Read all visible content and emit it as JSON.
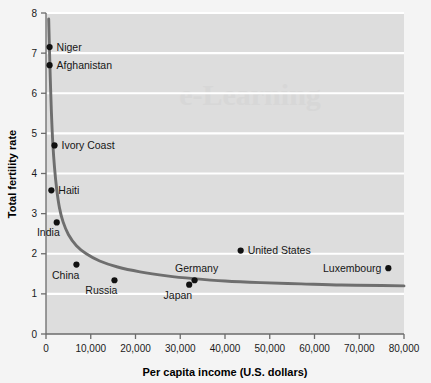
{
  "chart_data": {
    "type": "scatter",
    "title": "",
    "xlabel": "Per capita income (U.S. dollars)",
    "ylabel": "Total fertility rate",
    "xlim": [
      0,
      80000
    ],
    "ylim": [
      0,
      8
    ],
    "xticks": [
      0,
      10000,
      20000,
      30000,
      40000,
      50000,
      60000,
      70000,
      80000
    ],
    "xticklabels": [
      "0",
      "10,000",
      "20,000",
      "30,000",
      "40,000",
      "50,000",
      "60,000",
      "70,000",
      "80,000"
    ],
    "yticks": [
      0,
      1,
      2,
      3,
      4,
      5,
      6,
      7,
      8
    ],
    "yticklabels": [
      "0",
      "1",
      "2",
      "3",
      "4",
      "5",
      "6",
      "7",
      "8"
    ],
    "grid": "horizontal",
    "legend": "none",
    "points": [
      {
        "label": "Niger",
        "x": 800,
        "y": 7.15,
        "label_pos": "right"
      },
      {
        "label": "Afghanistan",
        "x": 800,
        "y": 6.7,
        "label_pos": "right"
      },
      {
        "label": "Ivory Coast",
        "x": 1900,
        "y": 4.7,
        "label_pos": "right"
      },
      {
        "label": "Haiti",
        "x": 1200,
        "y": 3.58,
        "label_pos": "right"
      },
      {
        "label": "India",
        "x": 2400,
        "y": 2.78,
        "label_pos": "below-left"
      },
      {
        "label": "China",
        "x": 6800,
        "y": 1.73,
        "label_pos": "below-left"
      },
      {
        "label": "Russia",
        "x": 15300,
        "y": 1.34,
        "label_pos": "below-left"
      },
      {
        "label": "Japan",
        "x": 32000,
        "y": 1.23,
        "label_pos": "below-left"
      },
      {
        "label": "Germany",
        "x": 33200,
        "y": 1.34,
        "label_pos": "above"
      },
      {
        "label": "United States",
        "x": 43500,
        "y": 2.08,
        "label_pos": "right"
      },
      {
        "label": "Luxembourg",
        "x": 76500,
        "y": 1.64,
        "label_pos": "left"
      }
    ],
    "trend_curve": {
      "description": "Decreasing hyperbolic fit of fertility rate versus per capita income",
      "points": [
        {
          "x": 600,
          "y": 7.85
        },
        {
          "x": 750,
          "y": 7.2
        },
        {
          "x": 950,
          "y": 6.4
        },
        {
          "x": 1200,
          "y": 5.55
        },
        {
          "x": 1500,
          "y": 4.8
        },
        {
          "x": 1900,
          "y": 4.15
        },
        {
          "x": 2400,
          "y": 3.6
        },
        {
          "x": 3000,
          "y": 3.15
        },
        {
          "x": 3800,
          "y": 2.8
        },
        {
          "x": 5000,
          "y": 2.48
        },
        {
          "x": 6800,
          "y": 2.2
        },
        {
          "x": 9000,
          "y": 2.0
        },
        {
          "x": 12000,
          "y": 1.82
        },
        {
          "x": 16000,
          "y": 1.67
        },
        {
          "x": 21000,
          "y": 1.55
        },
        {
          "x": 27000,
          "y": 1.45
        },
        {
          "x": 33000,
          "y": 1.38
        },
        {
          "x": 40000,
          "y": 1.32
        },
        {
          "x": 48000,
          "y": 1.28
        },
        {
          "x": 57000,
          "y": 1.25
        },
        {
          "x": 66000,
          "y": 1.22
        },
        {
          "x": 75000,
          "y": 1.21
        },
        {
          "x": 80000,
          "y": 1.2
        }
      ]
    },
    "colors": {
      "plot_background": "#dddddd",
      "page_background": "#f4f4f4",
      "gridline": "#ffffff",
      "axis": "#6b6b6b",
      "point": "#111111",
      "curve": "#6e6e6e"
    }
  },
  "watermark": {
    "text": "e-Learning"
  }
}
